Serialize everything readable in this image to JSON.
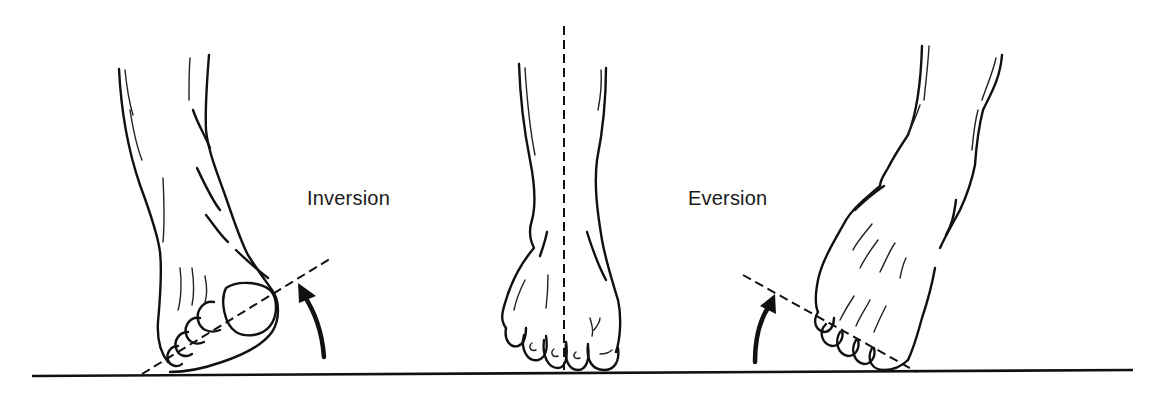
{
  "diagram": {
    "labels": {
      "inversion": "Inversion",
      "eversion": "Eversion"
    },
    "panels": [
      {
        "id": "left",
        "name": "inverted-foot",
        "label_key": "inversion",
        "motion": "sole turned inward, arrow curving upward"
      },
      {
        "id": "center",
        "name": "neutral-foot",
        "label_key": null,
        "motion": "neutral stance, vertical dashed midline"
      },
      {
        "id": "right",
        "name": "everted-foot",
        "label_key": "eversion",
        "motion": "sole turned outward, arrow curving upward"
      }
    ],
    "colors": {
      "ink": "#111111",
      "background": "#ffffff"
    }
  }
}
